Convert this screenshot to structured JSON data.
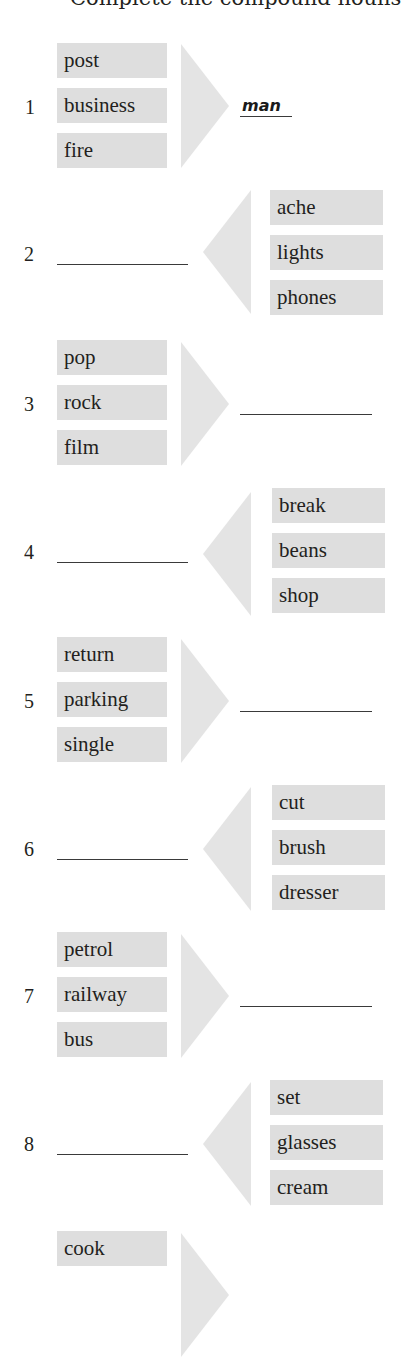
{
  "header": {
    "instruction_cut": "Complete the compound nouns"
  },
  "exercises": [
    {
      "number": "1",
      "direction": "right",
      "words": [
        "post",
        "business",
        "fire"
      ],
      "answer": "man"
    },
    {
      "number": "2",
      "direction": "left",
      "words": [
        "ache",
        "lights",
        "phones"
      ],
      "answer": ""
    },
    {
      "number": "3",
      "direction": "right",
      "words": [
        "pop",
        "rock",
        "film"
      ],
      "answer": ""
    },
    {
      "number": "4",
      "direction": "left",
      "words": [
        "break",
        "beans",
        "shop"
      ],
      "answer": ""
    },
    {
      "number": "5",
      "direction": "right",
      "words": [
        "return",
        "parking",
        "single"
      ],
      "answer": ""
    },
    {
      "number": "6",
      "direction": "left",
      "words": [
        "cut",
        "brush",
        "dresser"
      ],
      "answer": ""
    },
    {
      "number": "7",
      "direction": "right",
      "words": [
        "petrol",
        "railway",
        "bus"
      ],
      "answer": ""
    },
    {
      "number": "8",
      "direction": "left",
      "words": [
        "set",
        "glasses",
        "cream"
      ],
      "answer": ""
    },
    {
      "number": "9",
      "direction": "right",
      "words": [
        "cook"
      ],
      "answer": ""
    }
  ],
  "colors": {
    "box_fill": "#dedede",
    "arrow_fill": "#e4e4e4",
    "text": "#231f20",
    "underline": "#3a3a3a"
  }
}
